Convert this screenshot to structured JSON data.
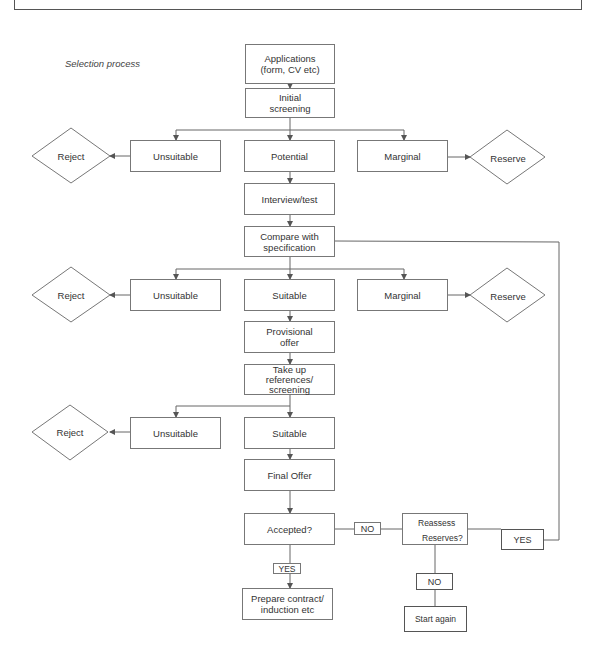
{
  "figure": {
    "title": "Selection process"
  },
  "nodes": {
    "applications": "Applications\n(form, CV etc)",
    "initial_screening": "Initial\nscreening",
    "stage1": {
      "reject": "Reject",
      "unsuitable": "Unsuitable",
      "potential": "Potential",
      "marginal": "Marginal",
      "reserve": "Reserve"
    },
    "interview": "Interview/test",
    "compare": "Compare with\nspecification",
    "stage2": {
      "reject": "Reject",
      "unsuitable": "Unsuitable",
      "suitable": "Suitable",
      "marginal": "Marginal",
      "reserve": "Reserve"
    },
    "provisional_offer": "Provisional\noffer",
    "take_up_references": "Take up\nreferences/\nscreening",
    "stage3": {
      "reject": "Reject",
      "unsuitable": "Unsuitable",
      "suitable": "Suitable"
    },
    "final_offer": "Final Offer",
    "accepted": "Accepted?",
    "reassess": {
      "line1": "Reassess",
      "line2": "Reserves?"
    },
    "prepare_contract": "Prepare contract/\ninduction etc",
    "start_again": "Start again"
  },
  "edge_labels": {
    "accepted_no": "NO",
    "accepted_yes": "YES",
    "reassess_yes": "YES",
    "reassess_no": "NO"
  },
  "colors": {
    "line": "#666666",
    "border": "#777777",
    "text": "#333333",
    "background": "#ffffff"
  }
}
